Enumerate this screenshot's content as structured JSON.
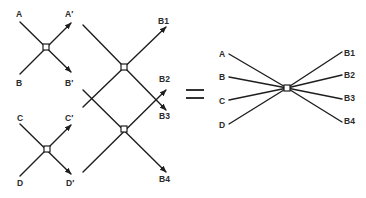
{
  "diagram": {
    "type": "scattering-network-equivalence",
    "left_network": {
      "inputs": [
        "A",
        "B",
        "C",
        "D"
      ],
      "intermediate_outputs": [
        "A′",
        "B′",
        "C′",
        "D′"
      ],
      "outputs": [
        "B1",
        "B2",
        "B3",
        "B4"
      ],
      "junctions": 4
    },
    "equals_sign": "=",
    "right_network": {
      "inputs": [
        "A",
        "B",
        "C",
        "D"
      ],
      "outputs": [
        "B1",
        "B2",
        "B3",
        "B4"
      ],
      "junctions": 1
    }
  },
  "labels": {
    "a": "A",
    "a_prime": "A′",
    "b": "B",
    "b_prime": "B′",
    "c": "C",
    "c_prime": "C′",
    "d": "D",
    "d_prime": "D′",
    "b1": "B1",
    "b2": "B2",
    "b3": "B3",
    "b4": "B4",
    "ra": "A",
    "rb": "B",
    "rc": "C",
    "rd": "D",
    "rb1": "B1",
    "rb2": "B2",
    "rb3": "B3",
    "rb4": "B4"
  },
  "colors": {
    "line": "#1e1e1e",
    "background": "#ffffff",
    "text": "#2a2a2a"
  }
}
